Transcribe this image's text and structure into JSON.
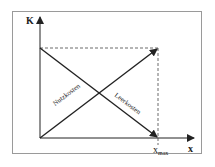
{
  "diagram": {
    "y_axis_label": "K",
    "x_axis_label": "x",
    "x_marker_label": "x",
    "x_marker_subscript": "max",
    "lines": [
      {
        "name": "Nutzkosten",
        "from": "origin",
        "to": "top-right",
        "direction": "rising"
      },
      {
        "name": "Leerkosten",
        "from": "top-left",
        "to": "bottom-right",
        "direction": "falling"
      }
    ],
    "labels": {
      "nutzkosten": "Nutzkosten",
      "leerkosten": "Leerkosten"
    },
    "colors": {
      "line": "#222222",
      "frame": "#9a9a9a",
      "background": "#ffffff"
    }
  }
}
